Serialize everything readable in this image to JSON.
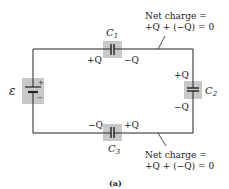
{
  "figure": {
    "caption": "(a)",
    "colors": {
      "wire": "#222222",
      "component_box": "#c8c8c8",
      "text": "#222222"
    }
  },
  "battery": {
    "symbol": "ε",
    "plus": "+",
    "minus": "−"
  },
  "capacitors": [
    {
      "name": "C",
      "sub": "1",
      "left_charge": "+Q",
      "right_charge": "−Q"
    },
    {
      "name": "C",
      "sub": "2",
      "top_charge": "+Q",
      "bottom_charge": "−Q"
    },
    {
      "name": "C",
      "sub": "3",
      "left_charge": "−Q",
      "right_charge": "+Q"
    }
  ],
  "annotations": [
    {
      "line1": "Net charge =",
      "line2": "+Q + (−Q) = 0"
    },
    {
      "line1": "Net charge =",
      "line2": "+Q + (−Q) = 0"
    }
  ]
}
